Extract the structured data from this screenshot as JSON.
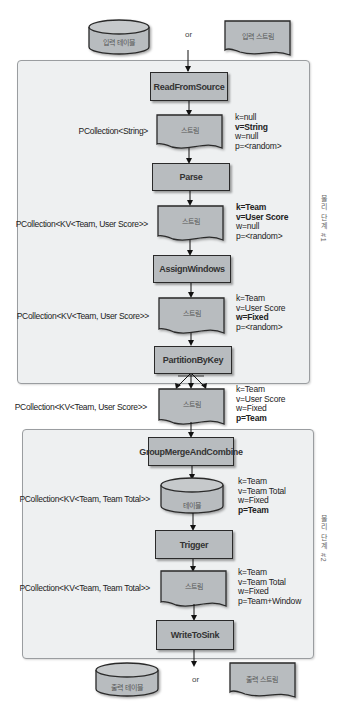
{
  "inputs": {
    "table_label": "입력 테이블",
    "or_label": "or",
    "stream_label": "입력 스트림"
  },
  "stage1": {
    "side_label": "물리 단계 #1",
    "steps": {
      "read": "ReadFromSource",
      "parse": "Parse",
      "assign": "AssignWindows",
      "partition": "PartitionByKey"
    },
    "collections": [
      {
        "label": "PCollection<String>",
        "shape": "스트림",
        "k": "k=null",
        "v": "v=String",
        "w": "w=null",
        "p": "p=<random>",
        "bold": [
          "v"
        ]
      },
      {
        "label": "PCollection<KV<Team, User Score>>",
        "shape": "스트림",
        "k": "k=Team",
        "v": "v=User Score",
        "w": "w=null",
        "p": "p=<random>",
        "bold": [
          "k",
          "v"
        ]
      },
      {
        "label": "PCollection<KV<Team, User Score>>",
        "shape": "스트림",
        "k": "k=Team",
        "v": "v=User Score",
        "w": "w=Fixed",
        "p": "p=<random>",
        "bold": [
          "w"
        ]
      }
    ]
  },
  "between": {
    "label": "PCollection<KV<Team, User Score>>",
    "shape": "스트림",
    "k": "k=Team",
    "v": "v=User Score",
    "w": "w=Fixed",
    "p": "p=Team",
    "bold": [
      "p"
    ]
  },
  "stage2": {
    "side_label": "물리 단계 #2",
    "steps": {
      "gmc": "GroupMergeAndCombine",
      "trigger": "Trigger",
      "write": "WriteToSink"
    },
    "collections": [
      {
        "label": "PCollection<KV<Team, Team Total>>",
        "shape": "테이블",
        "k": "k=Team",
        "v": "v=Team Total",
        "w": "w=Fixed",
        "p": "p=Team",
        "bold": [
          "p"
        ]
      },
      {
        "label": "PCollection<KV<Team, Team Total>>",
        "shape": "스트림",
        "k": "k=Team",
        "v": "v=Team Total",
        "w": "w=Fixed",
        "p": "p=Team+Window",
        "bold": []
      }
    ]
  },
  "outputs": {
    "table_label": "출력 테이블",
    "or_label": "or",
    "stream_label": "출력 스트림"
  },
  "colors": {
    "shape_fill": "#b8bcbf",
    "panel_fill": "#eef0f1",
    "border": "#2a2a2a"
  }
}
